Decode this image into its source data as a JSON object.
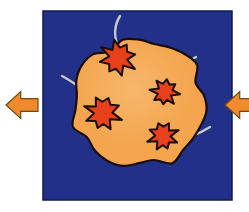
{
  "figure": {
    "caption": "",
    "canvas": {
      "width": 249,
      "height": 212,
      "background": "#ffffff"
    },
    "panel": {
      "name": "blue-square-panel",
      "x": 43,
      "y": 11,
      "width": 189,
      "height": 189,
      "fill": "#223089",
      "stroke": "#101a52",
      "stroke_width": 1.5
    },
    "body": {
      "name": "lumpy-sphere",
      "label": "",
      "fill": "#f4a54e",
      "highlight": "#f7b76c",
      "stroke": "#1a0d05",
      "stroke_width": 2.2,
      "center_x": 139,
      "center_y": 103,
      "radius": 64
    },
    "craters": [
      {
        "name": "crater-top-left",
        "cx": 118,
        "cy": 58,
        "r": 18,
        "rotation": -12
      },
      {
        "name": "crater-mid-left",
        "cx": 103,
        "cy": 113,
        "r": 18,
        "rotation": 20
      },
      {
        "name": "crater-mid-right",
        "cx": 165,
        "cy": 92,
        "r": 14,
        "rotation": 8
      },
      {
        "name": "crater-bottom-right",
        "cx": 163,
        "cy": 136,
        "r": 15,
        "rotation": -20
      }
    ],
    "crater_style": {
      "fill": "#e8401b",
      "stroke": "#1a0d05",
      "stroke_width": 2.0,
      "points": 8
    },
    "ejecta_trails": [
      {
        "name": "ejecta-trail-top",
        "path": "M 118 47 C 113 34 115 24 120 16"
      },
      {
        "name": "ejecta-trail-left",
        "path": "M 99 102 C 86 92 74 82 62 76"
      },
      {
        "name": "ejecta-trail-right",
        "path": "M 168 81 C 176 70 186 62 196 57"
      },
      {
        "name": "ejecta-trail-bottom-right",
        "path": "M 172 141 C 186 139 199 134 210 127"
      }
    ],
    "ejecta_style": {
      "stroke": "#c9c9c9",
      "stroke_width": 2.4
    },
    "arrows": [
      {
        "name": "arrow-left-outward",
        "direction": "left",
        "tip_x": 6,
        "center_y": 105,
        "length": 32,
        "clipped": false
      },
      {
        "name": "arrow-right-outward",
        "direction": "left",
        "tip_x": 225,
        "center_y": 105,
        "length": 32,
        "clipped": true
      }
    ],
    "arrow_style": {
      "fill": "#ef8b2c",
      "stroke": "#6b4a14",
      "stroke_width": 1.2
    }
  }
}
